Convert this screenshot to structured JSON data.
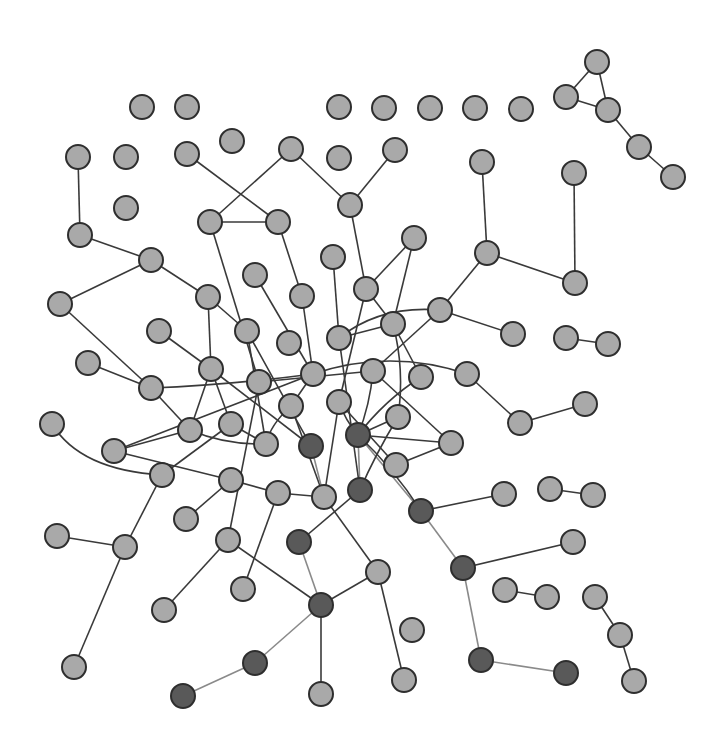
{
  "diagram": {
    "type": "network-graph",
    "width": 725,
    "height": 748,
    "node_radius": 12,
    "colors": {
      "node_fill": "#a9a9a9",
      "node_fill_highlight": "#595959",
      "node_stroke": "#2e2e2e",
      "edge": "#3a3a3a",
      "edge_highlight": "#8a8a8a",
      "background": "#ffffff"
    },
    "nodes": [
      {
        "id": "n1",
        "x": 142,
        "y": 107
      },
      {
        "id": "n2",
        "x": 187,
        "y": 107
      },
      {
        "id": "n3",
        "x": 339,
        "y": 107
      },
      {
        "id": "n4",
        "x": 384,
        "y": 108
      },
      {
        "id": "n5",
        "x": 430,
        "y": 108
      },
      {
        "id": "n6",
        "x": 475,
        "y": 108
      },
      {
        "id": "n7",
        "x": 521,
        "y": 109
      },
      {
        "id": "n8",
        "x": 597,
        "y": 62
      },
      {
        "id": "n9",
        "x": 566,
        "y": 97
      },
      {
        "id": "n10",
        "x": 608,
        "y": 110
      },
      {
        "id": "n11",
        "x": 639,
        "y": 147
      },
      {
        "id": "n12",
        "x": 673,
        "y": 177
      },
      {
        "id": "n13",
        "x": 232,
        "y": 141
      },
      {
        "id": "n14",
        "x": 78,
        "y": 157
      },
      {
        "id": "n15",
        "x": 126,
        "y": 157
      },
      {
        "id": "n16",
        "x": 187,
        "y": 154
      },
      {
        "id": "n17",
        "x": 291,
        "y": 149
      },
      {
        "id": "n18",
        "x": 339,
        "y": 158
      },
      {
        "id": "n19",
        "x": 395,
        "y": 150
      },
      {
        "id": "n20",
        "x": 482,
        "y": 162
      },
      {
        "id": "n21",
        "x": 574,
        "y": 173
      },
      {
        "id": "n22",
        "x": 126,
        "y": 208
      },
      {
        "id": "n23",
        "x": 80,
        "y": 235
      },
      {
        "id": "n24",
        "x": 210,
        "y": 222
      },
      {
        "id": "n25",
        "x": 278,
        "y": 222
      },
      {
        "id": "n26",
        "x": 350,
        "y": 205
      },
      {
        "id": "n27",
        "x": 151,
        "y": 260
      },
      {
        "id": "n28",
        "x": 333,
        "y": 257
      },
      {
        "id": "n29",
        "x": 414,
        "y": 238
      },
      {
        "id": "n30",
        "x": 487,
        "y": 253
      },
      {
        "id": "n31",
        "x": 575,
        "y": 283
      },
      {
        "id": "n32",
        "x": 60,
        "y": 304
      },
      {
        "id": "n33",
        "x": 208,
        "y": 297
      },
      {
        "id": "n34",
        "x": 255,
        "y": 275
      },
      {
        "id": "n35",
        "x": 302,
        "y": 296
      },
      {
        "id": "n36",
        "x": 366,
        "y": 289
      },
      {
        "id": "n37",
        "x": 159,
        "y": 331
      },
      {
        "id": "n38",
        "x": 247,
        "y": 331
      },
      {
        "id": "n39",
        "x": 289,
        "y": 343
      },
      {
        "id": "n40",
        "x": 339,
        "y": 338
      },
      {
        "id": "n41",
        "x": 393,
        "y": 324
      },
      {
        "id": "n42",
        "x": 440,
        "y": 310
      },
      {
        "id": "n43",
        "x": 513,
        "y": 334
      },
      {
        "id": "n44",
        "x": 566,
        "y": 338
      },
      {
        "id": "n45",
        "x": 608,
        "y": 344
      },
      {
        "id": "n46",
        "x": 88,
        "y": 363
      },
      {
        "id": "n47",
        "x": 151,
        "y": 388
      },
      {
        "id": "n48",
        "x": 211,
        "y": 369
      },
      {
        "id": "n49",
        "x": 259,
        "y": 382
      },
      {
        "id": "n50",
        "x": 313,
        "y": 374
      },
      {
        "id": "n51",
        "x": 373,
        "y": 371
      },
      {
        "id": "n52",
        "x": 421,
        "y": 377
      },
      {
        "id": "n53",
        "x": 467,
        "y": 374
      },
      {
        "id": "n54",
        "x": 52,
        "y": 424
      },
      {
        "id": "n55",
        "x": 190,
        "y": 430
      },
      {
        "id": "n56",
        "x": 231,
        "y": 424
      },
      {
        "id": "n57",
        "x": 291,
        "y": 406
      },
      {
        "id": "n58",
        "x": 339,
        "y": 402
      },
      {
        "id": "n59",
        "x": 398,
        "y": 417
      },
      {
        "id": "n60",
        "x": 585,
        "y": 404
      },
      {
        "id": "n61",
        "x": 520,
        "y": 423
      },
      {
        "id": "n62",
        "x": 114,
        "y": 451
      },
      {
        "id": "n63",
        "x": 162,
        "y": 475
      },
      {
        "id": "n64",
        "x": 266,
        "y": 444
      },
      {
        "id": "n65",
        "x": 311,
        "y": 446,
        "highlight": true
      },
      {
        "id": "n66",
        "x": 358,
        "y": 435,
        "highlight": true
      },
      {
        "id": "n67",
        "x": 396,
        "y": 465
      },
      {
        "id": "n68",
        "x": 451,
        "y": 443
      },
      {
        "id": "n69",
        "x": 231,
        "y": 480
      },
      {
        "id": "n70",
        "x": 278,
        "y": 493
      },
      {
        "id": "n71",
        "x": 324,
        "y": 497
      },
      {
        "id": "n72",
        "x": 360,
        "y": 490,
        "highlight": true
      },
      {
        "id": "n73",
        "x": 504,
        "y": 494
      },
      {
        "id": "n74",
        "x": 550,
        "y": 489
      },
      {
        "id": "n75",
        "x": 593,
        "y": 495
      },
      {
        "id": "n76",
        "x": 186,
        "y": 519
      },
      {
        "id": "n77",
        "x": 421,
        "y": 511,
        "highlight": true
      },
      {
        "id": "n78",
        "x": 57,
        "y": 536
      },
      {
        "id": "n79",
        "x": 125,
        "y": 547
      },
      {
        "id": "n80",
        "x": 228,
        "y": 540
      },
      {
        "id": "n81",
        "x": 299,
        "y": 542,
        "highlight": true
      },
      {
        "id": "n82",
        "x": 573,
        "y": 542
      },
      {
        "id": "n83",
        "x": 378,
        "y": 572
      },
      {
        "id": "n84",
        "x": 463,
        "y": 568,
        "highlight": true
      },
      {
        "id": "n85",
        "x": 164,
        "y": 610
      },
      {
        "id": "n86",
        "x": 243,
        "y": 589
      },
      {
        "id": "n87",
        "x": 321,
        "y": 605,
        "highlight": true
      },
      {
        "id": "n88",
        "x": 505,
        "y": 590
      },
      {
        "id": "n89",
        "x": 547,
        "y": 597
      },
      {
        "id": "n90",
        "x": 595,
        "y": 597
      },
      {
        "id": "n91",
        "x": 620,
        "y": 635
      },
      {
        "id": "n92",
        "x": 412,
        "y": 630
      },
      {
        "id": "n93",
        "x": 74,
        "y": 667
      },
      {
        "id": "n94",
        "x": 255,
        "y": 663,
        "highlight": true
      },
      {
        "id": "n95",
        "x": 481,
        "y": 660,
        "highlight": true
      },
      {
        "id": "n96",
        "x": 566,
        "y": 673,
        "highlight": true
      },
      {
        "id": "n97",
        "x": 404,
        "y": 680
      },
      {
        "id": "n98",
        "x": 183,
        "y": 696,
        "highlight": true
      },
      {
        "id": "n99",
        "x": 321,
        "y": 694
      },
      {
        "id": "n100",
        "x": 634,
        "y": 681
      }
    ],
    "edges": [
      {
        "from": "n8",
        "to": "n9"
      },
      {
        "from": "n8",
        "to": "n10"
      },
      {
        "from": "n9",
        "to": "n10"
      },
      {
        "from": "n10",
        "to": "n11"
      },
      {
        "from": "n11",
        "to": "n12"
      },
      {
        "from": "n14",
        "to": "n23"
      },
      {
        "from": "n16",
        "to": "n25"
      },
      {
        "from": "n17",
        "to": "n24"
      },
      {
        "from": "n17",
        "to": "n26"
      },
      {
        "from": "n24",
        "to": "n25"
      },
      {
        "from": "n19",
        "to": "n26"
      },
      {
        "from": "n20",
        "to": "n30"
      },
      {
        "from": "n21",
        "to": "n31"
      },
      {
        "from": "n23",
        "to": "n27"
      },
      {
        "from": "n27",
        "to": "n32"
      },
      {
        "from": "n27",
        "to": "n33"
      },
      {
        "from": "n30",
        "to": "n31"
      },
      {
        "from": "n30",
        "to": "n42"
      },
      {
        "from": "n24",
        "to": "n49"
      },
      {
        "from": "n25",
        "to": "n35"
      },
      {
        "from": "n26",
        "to": "n36"
      },
      {
        "from": "n28",
        "to": "n40"
      },
      {
        "from": "n29",
        "to": "n36"
      },
      {
        "from": "n29",
        "to": "n41"
      },
      {
        "from": "n32",
        "to": "n47"
      },
      {
        "from": "n33",
        "to": "n38"
      },
      {
        "from": "n33",
        "to": "n48"
      },
      {
        "from": "n34",
        "to": "n50"
      },
      {
        "from": "n35",
        "to": "n50"
      },
      {
        "from": "n36",
        "to": "n41"
      },
      {
        "from": "n36",
        "to": "n58"
      },
      {
        "from": "n37",
        "to": "n48"
      },
      {
        "from": "n38",
        "to": "n64"
      },
      {
        "from": "n40",
        "to": "n41"
      },
      {
        "from": "n42",
        "to": "n43"
      },
      {
        "from": "n42",
        "to": "n51"
      },
      {
        "from": "n44",
        "to": "n45"
      },
      {
        "from": "n46",
        "to": "n47"
      },
      {
        "from": "n47",
        "to": "n55"
      },
      {
        "from": "n48",
        "to": "n55"
      },
      {
        "from": "n48",
        "to": "n56"
      },
      {
        "from": "n48",
        "to": "n65"
      },
      {
        "from": "n50",
        "to": "n57"
      },
      {
        "from": "n50",
        "to": "n62"
      },
      {
        "from": "n51",
        "to": "n68"
      },
      {
        "from": "n52",
        "to": "n41"
      },
      {
        "from": "n53",
        "to": "n61"
      },
      {
        "from": "n60",
        "to": "n61"
      },
      {
        "from": "n55",
        "to": "n62"
      },
      {
        "from": "n56",
        "to": "n64"
      },
      {
        "from": "n56",
        "to": "n63"
      },
      {
        "from": "n57",
        "to": "n71"
      },
      {
        "from": "n58",
        "to": "n67"
      },
      {
        "from": "n59",
        "to": "n66"
      },
      {
        "from": "n65",
        "to": "n71",
        "highlight": true
      },
      {
        "from": "n66",
        "to": "n68"
      },
      {
        "from": "n66",
        "to": "n72",
        "highlight": true
      },
      {
        "from": "n66",
        "to": "n77",
        "highlight": true
      },
      {
        "from": "n67",
        "to": "n68"
      },
      {
        "from": "n69",
        "to": "n70"
      },
      {
        "from": "n70",
        "to": "n71"
      },
      {
        "from": "n71",
        "to": "n83"
      },
      {
        "from": "n74",
        "to": "n75"
      },
      {
        "from": "n77",
        "to": "n73"
      },
      {
        "from": "n77",
        "to": "n84",
        "highlight": true
      },
      {
        "from": "n63",
        "to": "n79"
      },
      {
        "from": "n78",
        "to": "n79"
      },
      {
        "from": "n79",
        "to": "n93"
      },
      {
        "from": "n80",
        "to": "n85"
      },
      {
        "from": "n80",
        "to": "n87"
      },
      {
        "from": "n81",
        "to": "n87",
        "highlight": true
      },
      {
        "from": "n83",
        "to": "n87"
      },
      {
        "from": "n83",
        "to": "n97"
      },
      {
        "from": "n84",
        "to": "n82"
      },
      {
        "from": "n84",
        "to": "n95",
        "highlight": true
      },
      {
        "from": "n87",
        "to": "n94",
        "highlight": true
      },
      {
        "from": "n87",
        "to": "n99"
      },
      {
        "from": "n88",
        "to": "n89"
      },
      {
        "from": "n90",
        "to": "n91"
      },
      {
        "from": "n91",
        "to": "n100"
      },
      {
        "from": "n94",
        "to": "n98",
        "highlight": true
      },
      {
        "from": "n95",
        "to": "n96",
        "highlight": true
      },
      {
        "from": "n69",
        "to": "n76"
      },
      {
        "from": "n86",
        "to": "n70"
      },
      {
        "from": "n81",
        "to": "n72"
      },
      {
        "from": "n40",
        "to": "n72"
      },
      {
        "from": "n49",
        "to": "n80"
      },
      {
        "from": "n49",
        "to": "n51"
      },
      {
        "from": "n58",
        "to": "n71"
      },
      {
        "from": "n62",
        "to": "n69"
      }
    ],
    "curved_edges": [
      {
        "from": "n47",
        "to": "n50",
        "d": "M151,388 Q230,385 313,374"
      },
      {
        "from": "n50",
        "to": "n53",
        "d": "M313,374 Q390,348 467,374"
      },
      {
        "from": "n40",
        "to": "n42",
        "d": "M339,338 Q380,305 440,310"
      },
      {
        "from": "n54",
        "to": "n63",
        "d": "M52,424 Q80,470 162,475"
      },
      {
        "from": "n55",
        "to": "n64",
        "d": "M190,430 Q225,445 266,444"
      },
      {
        "from": "n38",
        "to": "n65",
        "d": "M247,331 Q285,400 311,446"
      },
      {
        "from": "n57",
        "to": "n64",
        "d": "M291,406 Q270,425 266,444"
      },
      {
        "from": "n58",
        "to": "n66",
        "d": "M339,402 Q345,420 358,435"
      },
      {
        "from": "n51",
        "to": "n66",
        "d": "M373,371 Q370,405 358,435"
      },
      {
        "from": "n41",
        "to": "n59",
        "d": "M393,324 Q405,370 398,417"
      },
      {
        "from": "n52",
        "to": "n66",
        "d": "M421,377 Q385,400 358,435"
      },
      {
        "from": "n66",
        "to": "n77",
        "d": "M358,435 Q395,470 421,511"
      },
      {
        "from": "n59",
        "to": "n72",
        "d": "M398,417 Q375,455 360,490"
      }
    ]
  }
}
